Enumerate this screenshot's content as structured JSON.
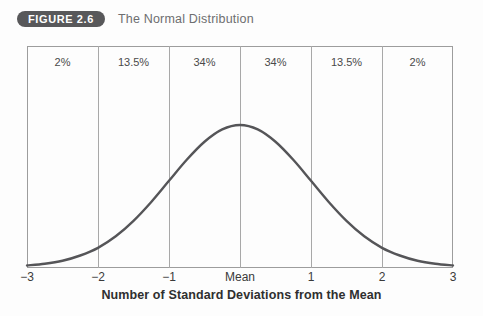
{
  "header": {
    "badge": "FIGURE 2.6",
    "title": "The Normal Distribution"
  },
  "colors": {
    "badge_bg": "#58585a",
    "badge_text": "#ffffff",
    "title_text": "#6e6e70",
    "frame": "#9d9d9d",
    "gridline": "#a8a8a8",
    "curve": "#555558",
    "background": "#fdfdfd"
  },
  "chart_data": {
    "type": "line",
    "title": "The Normal Distribution",
    "xlabel": "Number of Standard Deviations from the Mean",
    "ylabel": "",
    "xlim": [
      -3,
      3
    ],
    "ylim": [
      0,
      1
    ],
    "grid": true,
    "legend": "none",
    "x_tick_values": [
      -3,
      -2,
      -1,
      0,
      1,
      2,
      3
    ],
    "x_tick_labels": [
      "−3",
      "−2",
      "−1",
      "Mean",
      "1",
      "2",
      "3"
    ],
    "band_labels": [
      "2%",
      "13.5%",
      "34%",
      "34%",
      "13.5%",
      "2%"
    ],
    "band_centers": [
      -2.5,
      -1.5,
      -0.5,
      0.5,
      1.5,
      2.5
    ],
    "series": [
      {
        "name": "Normal curve",
        "x": [
          -3,
          -2.75,
          -2.5,
          -2.25,
          -2,
          -1.75,
          -1.5,
          -1.25,
          -1,
          -0.75,
          -0.5,
          -0.25,
          0,
          0.25,
          0.5,
          0.75,
          1,
          1.25,
          1.5,
          1.75,
          2,
          2.25,
          2.5,
          2.75,
          3
        ],
        "y": [
          0.011,
          0.023,
          0.044,
          0.081,
          0.135,
          0.216,
          0.325,
          0.458,
          0.607,
          0.755,
          0.882,
          0.969,
          1.0,
          0.969,
          0.882,
          0.755,
          0.607,
          0.458,
          0.325,
          0.216,
          0.135,
          0.081,
          0.044,
          0.023,
          0.011
        ]
      }
    ]
  }
}
